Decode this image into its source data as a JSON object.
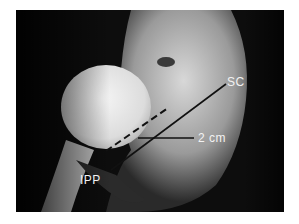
{
  "figure": {
    "type": "radiograph",
    "colors": {
      "background": "#0d0d0d",
      "bone": "#cfcfcf",
      "implant": "#f0f0f0",
      "annotation": "#111111",
      "label": "#f2f2f2"
    }
  },
  "annotations": {
    "sc_label": "SC",
    "ipp_label": "IPP",
    "distance_label": "2 cm"
  }
}
